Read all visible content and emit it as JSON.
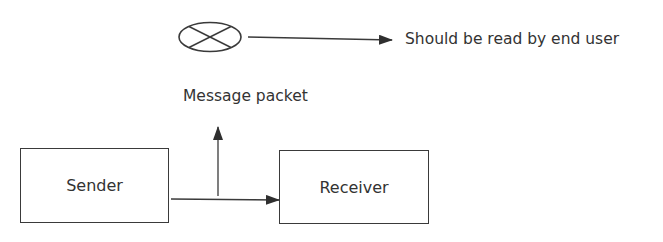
{
  "diagram": {
    "nodes": {
      "message_symbol": {
        "shape": "crossed-ellipse",
        "icon": "crossed-circle-icon"
      },
      "message_label": "Message packet",
      "end_user_label": "Should be read by end user",
      "sender": {
        "label": "Sender"
      },
      "receiver": {
        "label": "Receiver"
      }
    },
    "edges": [
      {
        "from": "message_symbol",
        "to": "end_user_label",
        "type": "arrow"
      },
      {
        "from": "sender",
        "to": "receiver",
        "type": "arrow"
      },
      {
        "from": "sender-receiver-link",
        "to": "message_label",
        "type": "arrow"
      }
    ],
    "colors": {
      "stroke": "#3a3a3a",
      "text": "#333333",
      "background": "#ffffff"
    }
  }
}
